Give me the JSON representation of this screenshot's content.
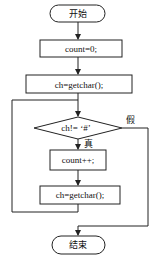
{
  "flowchart": {
    "start": "开始",
    "init": "count=0;",
    "read1": "ch=getchar();",
    "condition": "ch!=  ‘#’",
    "true_label": "真",
    "false_label": "假",
    "increment": "count++;",
    "read2": "ch=getchar();",
    "end": "结束"
  },
  "colors": {
    "stroke": "#222222",
    "background": "#ffffff"
  }
}
